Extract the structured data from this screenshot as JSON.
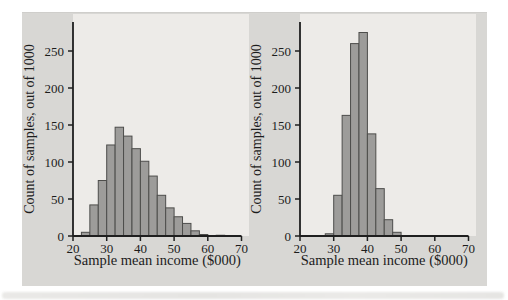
{
  "figure": {
    "card_color": "#d8d7d4",
    "panel_color": "#edebe8",
    "bar_fill": "#9d9c9a",
    "bar_stroke": "#4d4d4b",
    "axis_color": "#1f1f1f",
    "text_color": "#1c1c1c"
  },
  "chart_data": [
    {
      "type": "bar",
      "subtype": "histogram",
      "title": "",
      "xlabel": "Sample mean income ($000)",
      "ylabel": "Count of samples, out of 1000",
      "xlim": [
        20,
        70
      ],
      "ylim": [
        0,
        290
      ],
      "xticks": [
        20,
        30,
        40,
        50,
        60,
        70
      ],
      "yticks": [
        0,
        50,
        100,
        150,
        200,
        250
      ],
      "grid": false,
      "legend": false,
      "bin_width": 2.5,
      "bin_start": 22.5,
      "values": [
        5,
        42,
        75,
        123,
        147,
        135,
        118,
        101,
        81,
        55,
        38,
        26,
        17,
        7,
        2,
        0,
        1
      ]
    },
    {
      "type": "bar",
      "subtype": "histogram",
      "title": "",
      "xlabel": "Sample mean income ($000)",
      "ylabel": "Count of samples, out of 1000",
      "xlim": [
        20,
        70
      ],
      "ylim": [
        0,
        290
      ],
      "xticks": [
        20,
        30,
        40,
        50,
        60,
        70
      ],
      "yticks": [
        0,
        50,
        100,
        150,
        200,
        250
      ],
      "grid": false,
      "legend": false,
      "bin_width": 2.5,
      "bin_start": 27.5,
      "values": [
        3,
        55,
        163,
        260,
        275,
        138,
        64,
        22,
        5
      ]
    }
  ]
}
